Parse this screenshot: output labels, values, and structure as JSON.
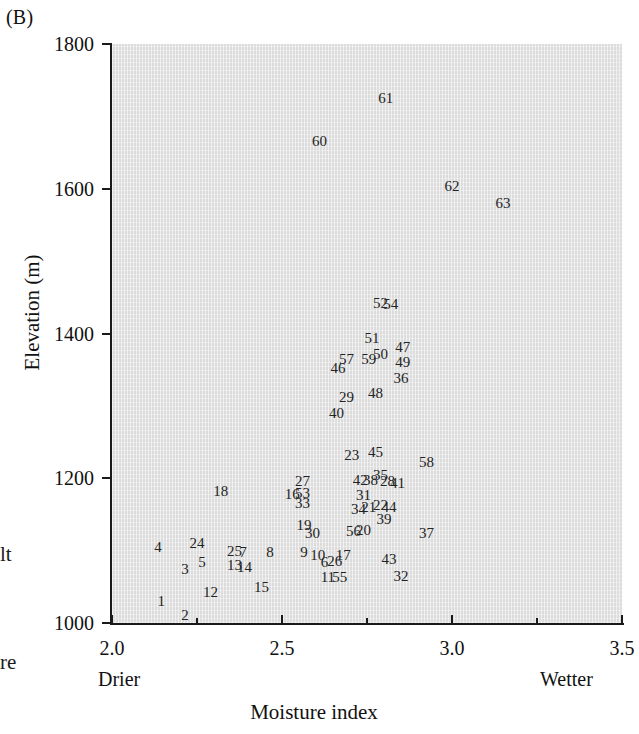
{
  "panel": {
    "letter": "(B)"
  },
  "margin_fragments": {
    "frag1": "lt",
    "frag2": "re"
  },
  "axes": {
    "y_title": "Elevation (m)",
    "x_title": "Moisture index",
    "drier_note": "Drier",
    "wetter_note": "Wetter",
    "y_ticks": [
      "1000",
      "1200",
      "1400",
      "1600",
      "1800"
    ],
    "x_ticks": [
      "2.0",
      "2.5",
      "3.0",
      "3.5"
    ]
  },
  "chart_data": {
    "type": "scatter",
    "title": "(B)",
    "xlabel": "Moisture index",
    "ylabel": "Elevation (m)",
    "xlim": [
      2.0,
      3.5
    ],
    "ylim": [
      1000,
      1800
    ],
    "grid": false,
    "legend": "none",
    "point_style": "numeric-text-label",
    "annotations": [
      "Drier",
      "Wetter"
    ],
    "points": [
      {
        "label": "1",
        "x": 2.145,
        "y": 1030
      },
      {
        "label": "2",
        "x": 2.215,
        "y": 1011
      },
      {
        "label": "3",
        "x": 2.215,
        "y": 1074
      },
      {
        "label": "4",
        "x": 2.135,
        "y": 1105
      },
      {
        "label": "5",
        "x": 2.265,
        "y": 1084
      },
      {
        "label": "6",
        "x": 2.625,
        "y": 1084
      },
      {
        "label": "7",
        "x": 2.385,
        "y": 1098
      },
      {
        "label": "8",
        "x": 2.465,
        "y": 1098
      },
      {
        "label": "9",
        "x": 2.565,
        "y": 1098
      },
      {
        "label": "10",
        "x": 2.605,
        "y": 1094
      },
      {
        "label": "11",
        "x": 2.635,
        "y": 1064
      },
      {
        "label": "12",
        "x": 2.29,
        "y": 1043
      },
      {
        "label": "13",
        "x": 2.36,
        "y": 1080
      },
      {
        "label": "14",
        "x": 2.39,
        "y": 1078
      },
      {
        "label": "15",
        "x": 2.44,
        "y": 1050
      },
      {
        "label": "16",
        "x": 2.53,
        "y": 1178
      },
      {
        "label": "17",
        "x": 2.68,
        "y": 1094
      },
      {
        "label": "18",
        "x": 2.32,
        "y": 1182
      },
      {
        "label": "19",
        "x": 2.565,
        "y": 1136
      },
      {
        "label": "20",
        "x": 2.74,
        "y": 1128
      },
      {
        "label": "21",
        "x": 2.755,
        "y": 1160
      },
      {
        "label": "22",
        "x": 2.79,
        "y": 1163
      },
      {
        "label": "23",
        "x": 2.705,
        "y": 1232
      },
      {
        "label": "24",
        "x": 2.25,
        "y": 1110
      },
      {
        "label": "25",
        "x": 2.36,
        "y": 1100
      },
      {
        "label": "26",
        "x": 2.655,
        "y": 1086
      },
      {
        "label": "27",
        "x": 2.56,
        "y": 1196
      },
      {
        "label": "28",
        "x": 2.81,
        "y": 1196
      },
      {
        "label": "29",
        "x": 2.69,
        "y": 1312
      },
      {
        "label": "30",
        "x": 2.59,
        "y": 1124
      },
      {
        "label": "31",
        "x": 2.74,
        "y": 1177
      },
      {
        "label": "32",
        "x": 2.85,
        "y": 1065
      },
      {
        "label": "33",
        "x": 2.56,
        "y": 1166
      },
      {
        "label": "34",
        "x": 2.725,
        "y": 1158
      },
      {
        "label": "35",
        "x": 2.79,
        "y": 1204
      },
      {
        "label": "36",
        "x": 2.85,
        "y": 1338
      },
      {
        "label": "37",
        "x": 2.925,
        "y": 1124
      },
      {
        "label": "38",
        "x": 2.76,
        "y": 1198
      },
      {
        "label": "39",
        "x": 2.8,
        "y": 1144
      },
      {
        "label": "40",
        "x": 2.66,
        "y": 1290
      },
      {
        "label": "41",
        "x": 2.84,
        "y": 1193
      },
      {
        "label": "42",
        "x": 2.73,
        "y": 1198
      },
      {
        "label": "43",
        "x": 2.815,
        "y": 1088
      },
      {
        "label": "44",
        "x": 2.815,
        "y": 1160
      },
      {
        "label": "45",
        "x": 2.775,
        "y": 1236
      },
      {
        "label": "46",
        "x": 2.665,
        "y": 1353
      },
      {
        "label": "47",
        "x": 2.855,
        "y": 1382
      },
      {
        "label": "48",
        "x": 2.775,
        "y": 1318
      },
      {
        "label": "49",
        "x": 2.855,
        "y": 1360
      },
      {
        "label": "50",
        "x": 2.79,
        "y": 1372
      },
      {
        "label": "51",
        "x": 2.765,
        "y": 1394
      },
      {
        "label": "52",
        "x": 2.79,
        "y": 1442
      },
      {
        "label": "53",
        "x": 2.56,
        "y": 1180
      },
      {
        "label": "54",
        "x": 2.82,
        "y": 1441
      },
      {
        "label": "55",
        "x": 2.67,
        "y": 1063
      },
      {
        "label": "56",
        "x": 2.71,
        "y": 1127
      },
      {
        "label": "57",
        "x": 2.69,
        "y": 1365
      },
      {
        "label": "58",
        "x": 2.925,
        "y": 1223
      },
      {
        "label": "59",
        "x": 2.755,
        "y": 1365
      },
      {
        "label": "60",
        "x": 2.61,
        "y": 1666
      },
      {
        "label": "61",
        "x": 2.805,
        "y": 1726
      },
      {
        "label": "62",
        "x": 3.0,
        "y": 1604
      },
      {
        "label": "63",
        "x": 3.15,
        "y": 1581
      }
    ]
  }
}
